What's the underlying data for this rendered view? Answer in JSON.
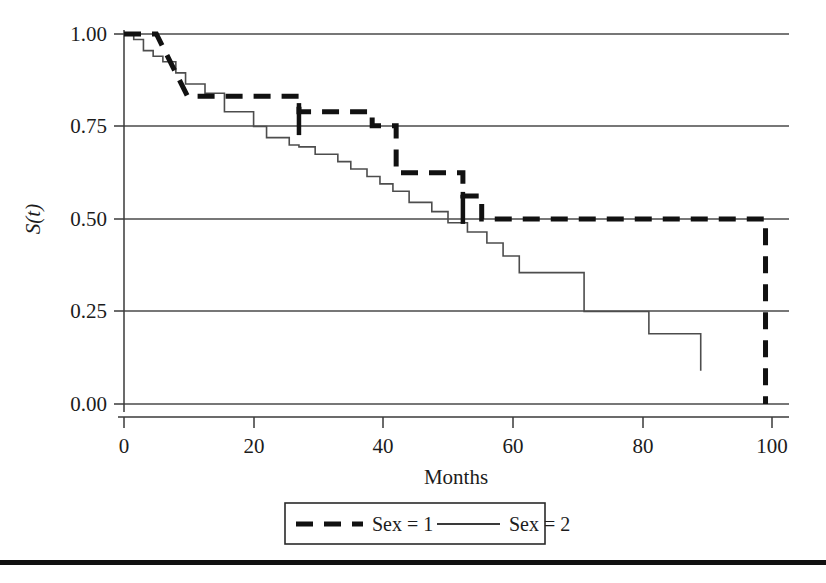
{
  "figure": {
    "kind": "kaplan-meier-survival-plot",
    "background": "#ffffff",
    "ink_color": "#111111",
    "grid_color": "#4a4a4a"
  },
  "chart_data": {
    "type": "line",
    "title": "",
    "subtitle": "",
    "xlabel": "Months",
    "ylabel": "S(t)",
    "ylabel_plain": "S(t)",
    "xlim": [
      0,
      103
    ],
    "ylim": [
      0.0,
      1.0
    ],
    "xticks": [
      0,
      20,
      40,
      60,
      80,
      100
    ],
    "xticklabels": [
      "0",
      "20",
      "40",
      "60",
      "80",
      "100"
    ],
    "yticks": [
      0.0,
      0.25,
      0.5,
      0.75,
      1.0
    ],
    "yticklabels": [
      "0.00",
      "0.25",
      "0.50",
      "0.75",
      "1.00"
    ],
    "grid": "horizontal",
    "legend_position": "below-axes",
    "series": [
      {
        "name": "Sex = 1",
        "style": "dashed",
        "linewidth": 5,
        "color": "#111111",
        "step": "post",
        "x": [
          0,
          5,
          6.5,
          9.8,
          20.2,
          27.0,
          38.3,
          42.0,
          47.0,
          52.3,
          55.2,
          99.0,
          99.0
        ],
        "y": [
          1.0,
          1.0,
          0.965,
          0.832,
          0.832,
          0.79,
          0.752,
          0.625,
          0.625,
          0.562,
          0.5,
          0.382,
          0.0
        ],
        "censor_x": [
          27.0,
          52.3
        ],
        "censor_y": [
          0.77,
          0.53
        ]
      },
      {
        "name": "Sex = 2",
        "style": "solid",
        "linewidth": 1.6,
        "color": "#4d4d4d",
        "step": "post",
        "x": [
          0,
          1.5,
          3.0,
          4.5,
          6.0,
          8.0,
          9.5,
          12.5,
          15.5,
          20.0,
          22.0,
          25.5,
          27.0,
          29.5,
          33.0,
          35.0,
          37.5,
          39.5,
          41.5,
          44.0,
          47.5,
          50.0,
          53.0,
          56.0,
          58.5,
          61.0,
          71.0,
          81.0,
          89.0
        ],
        "y": [
          1.0,
          0.985,
          0.955,
          0.94,
          0.925,
          0.895,
          0.865,
          0.84,
          0.79,
          0.75,
          0.72,
          0.7,
          0.695,
          0.675,
          0.655,
          0.635,
          0.615,
          0.595,
          0.575,
          0.545,
          0.52,
          0.49,
          0.465,
          0.435,
          0.4,
          0.355,
          0.25,
          0.19,
          0.09
        ]
      }
    ]
  },
  "legend": {
    "entries": [
      {
        "label": "Sex = 1",
        "style": "dashed"
      },
      {
        "label": "Sex = 2",
        "style": "solid"
      }
    ]
  }
}
